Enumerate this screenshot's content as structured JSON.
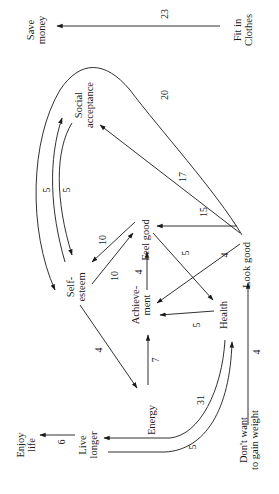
{
  "diagram": {
    "title": "",
    "orientation": "rotated-90-ccw",
    "nodes": [
      {
        "id": "save_money",
        "lines": [
          "Save",
          "money"
        ]
      },
      {
        "id": "fit_in_clothes",
        "lines": [
          "Fit in",
          "Clothes"
        ]
      },
      {
        "id": "social_acceptance",
        "lines": [
          "Social",
          "acceptance"
        ]
      },
      {
        "id": "self_esteem",
        "lines": [
          "Self-",
          "esteem"
        ]
      },
      {
        "id": "feel_good",
        "lines": [
          "Feel good"
        ]
      },
      {
        "id": "look_good",
        "lines": [
          "Look good"
        ]
      },
      {
        "id": "achievement",
        "lines": [
          "Achieve-",
          "ment"
        ]
      },
      {
        "id": "health",
        "lines": [
          "Health"
        ]
      },
      {
        "id": "energy",
        "lines": [
          "Energy"
        ]
      },
      {
        "id": "dont_want_gain_weight",
        "lines": [
          "Don't want",
          "to gain weight"
        ]
      },
      {
        "id": "live_longer",
        "lines": [
          "Live",
          "longer"
        ]
      },
      {
        "id": "enjoy_life",
        "lines": [
          "Enjoy",
          "life"
        ]
      }
    ],
    "edges": [
      {
        "from": "fit_in_clothes",
        "to": "save_money",
        "weight": "23"
      },
      {
        "from": "look_good",
        "to": "self_esteem",
        "weight": "20"
      },
      {
        "from": "look_good",
        "to": "social_acceptance",
        "weight": "17"
      },
      {
        "from": "social_acceptance",
        "to": "self_esteem",
        "weight": "5"
      },
      {
        "from": "self_esteem",
        "to": "social_acceptance",
        "weight": "5"
      },
      {
        "from": "feel_good",
        "to": "self_esteem",
        "weight": "10"
      },
      {
        "from": "self_esteem",
        "to": "feel_good",
        "weight": "10"
      },
      {
        "from": "look_good",
        "to": "feel_good",
        "weight": "15"
      },
      {
        "from": "achievement",
        "to": "feel_good",
        "weight": "4"
      },
      {
        "from": "feel_good",
        "to": "health",
        "weight": "5"
      },
      {
        "from": "look_good",
        "to": "achievement",
        "weight": "4"
      },
      {
        "from": "health",
        "to": "achievement",
        "weight": "5"
      },
      {
        "from": "energy",
        "to": "achievement",
        "weight": "7"
      },
      {
        "from": "self_esteem",
        "to": "energy",
        "weight": "4"
      },
      {
        "from": "dont_want_gain_weight",
        "to": "look_good",
        "weight": "4"
      },
      {
        "from": "health",
        "to": "live_longer",
        "weight": "31"
      },
      {
        "from": "live_longer",
        "to": "health",
        "weight": "5"
      },
      {
        "from": "live_longer",
        "to": "enjoy_life",
        "weight": "6"
      }
    ]
  }
}
